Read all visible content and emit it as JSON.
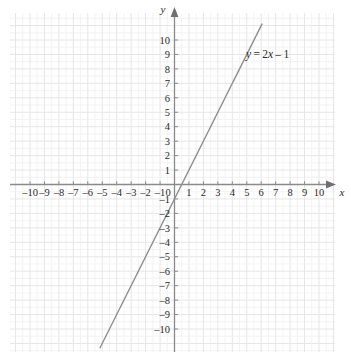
{
  "figure": {
    "kind": "cartesian-coordinate-plane",
    "background_color": "#ffffff",
    "grid_color_minor": "#f0f0f0",
    "grid_color_major": "#e6e6e6",
    "axis_color": "#8a8a8a",
    "line_color": "#8f8f8f",
    "text_color": "#2b2b2b"
  },
  "axes": {
    "x_label": "x",
    "y_label": "y",
    "origin_label": "0",
    "x_ticks": [
      "–10",
      "–9",
      "–8",
      "–7",
      "–6",
      "–5",
      "–4",
      "–3",
      "–2",
      "–1",
      "1",
      "2",
      "3",
      "4",
      "5",
      "6",
      "7",
      "8",
      "9",
      "10"
    ],
    "y_ticks": [
      "10",
      "9",
      "8",
      "7",
      "6",
      "5",
      "4",
      "3",
      "2",
      "1",
      "–1",
      "–2",
      "–3",
      "–4",
      "–5",
      "–6",
      "–7",
      "–8",
      "–9",
      "–10"
    ],
    "x_arrow": true,
    "y_arrow": true
  },
  "annotations": {
    "equation_label": "y = 2x – 1",
    "equation_parts": {
      "y": "y",
      "equals": " = ",
      "coefficient": "2",
      "variable": "x",
      "operator": " – ",
      "constant": "1"
    }
  },
  "chart_data": {
    "type": "line",
    "title": "",
    "xlabel": "x",
    "ylabel": "y",
    "xlim": [
      -11.3,
      11.3
    ],
    "ylim": [
      -11.6,
      11.6
    ],
    "grid": true,
    "grid_major_step": 1,
    "grid_minor_step": 0.5,
    "legend": "none",
    "series": [
      {
        "name": "y = 2x – 1",
        "equation": "y = 2x - 1",
        "slope": 2,
        "intercept": -1,
        "x_intercept": 0.5,
        "color": "#8f8f8f",
        "x": [
          -5.15,
          6.05
        ],
        "y": [
          -11.3,
          11.1
        ],
        "points": [
          {
            "x": -5,
            "y": -11
          },
          {
            "x": -4,
            "y": -9
          },
          {
            "x": -3,
            "y": -7
          },
          {
            "x": -2,
            "y": -5
          },
          {
            "x": -1,
            "y": -3
          },
          {
            "x": 0,
            "y": -1
          },
          {
            "x": 0.5,
            "y": 0
          },
          {
            "x": 1,
            "y": 1
          },
          {
            "x": 2,
            "y": 3
          },
          {
            "x": 3,
            "y": 5
          },
          {
            "x": 4,
            "y": 7
          },
          {
            "x": 5,
            "y": 9
          },
          {
            "x": 6,
            "y": 11
          }
        ]
      }
    ]
  }
}
